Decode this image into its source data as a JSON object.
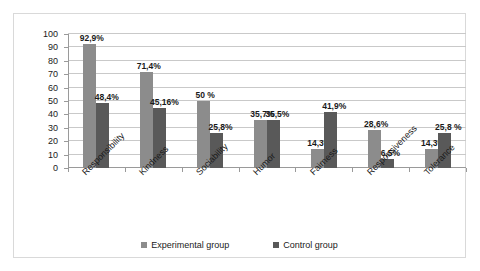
{
  "chart_data": {
    "type": "bar",
    "title": "",
    "subtitle": "",
    "xlabel": "",
    "ylabel": "",
    "ylim": [
      0,
      100
    ],
    "yticks": [
      0,
      10,
      20,
      30,
      40,
      50,
      60,
      70,
      80,
      90,
      100
    ],
    "grid": true,
    "legend_position": "bottom",
    "categories": [
      "Responsibility",
      "Kindness",
      "Sociability",
      "Humor",
      "Fairness",
      "Responsiveness",
      "Tolerance"
    ],
    "series": [
      {
        "name": "Experimental group",
        "color": "#8c8c8c",
        "values": [
          92.9,
          71.4,
          50.0,
          35.7,
          14.3,
          28.6,
          14.3
        ],
        "labels": [
          "92,9%",
          "71,4%",
          "50 %",
          "35,7%",
          "14,3%",
          "28,6%",
          "14,3%"
        ]
      },
      {
        "name": "Control group",
        "color": "#595959",
        "values": [
          48.4,
          45.16,
          25.8,
          35.5,
          41.9,
          6.5,
          25.8
        ],
        "labels": [
          "48,4%",
          "45,16%",
          "25,8%",
          "35,5%",
          "41,9%",
          "6,5%",
          "25,8 %"
        ]
      }
    ]
  },
  "colors": {
    "experimental": "#8c8c8c",
    "control": "#595959",
    "gridline": "#c9c9c9",
    "axis": "#9a9a9a",
    "frame_border": "#d9d9d9",
    "background": "#ffffff"
  }
}
